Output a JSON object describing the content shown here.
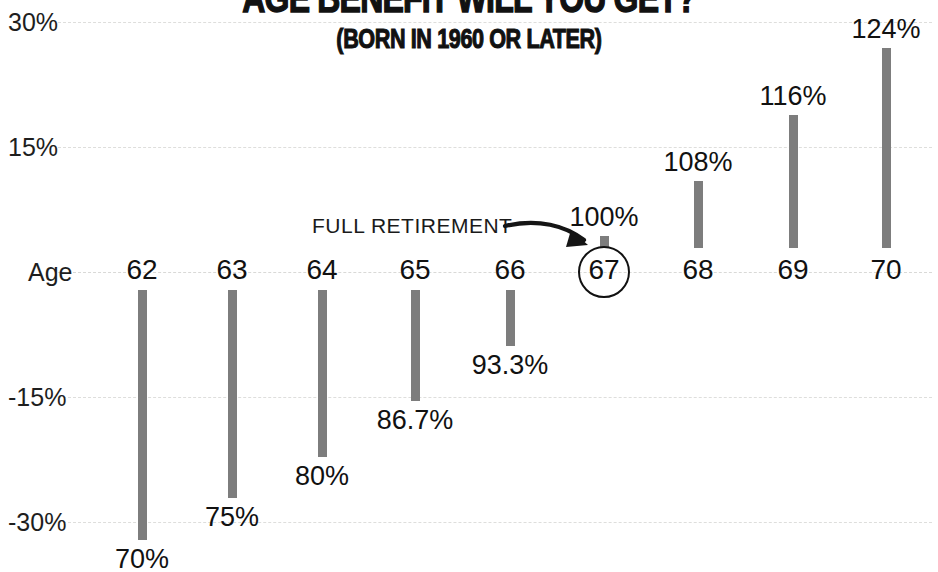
{
  "title": "AGE BENEFIT WILL YOU GET?",
  "subtitle": "(BORN IN 1960 OR LATER)",
  "axis_label": "Age",
  "annotation": "FULL RETIREMENT",
  "colors": {
    "bar": "#7d7d7d",
    "text": "#111111",
    "grid": "#dededc",
    "background": "#ffffff"
  },
  "yticks": [
    {
      "label": "30%",
      "value": 30
    },
    {
      "label": "15%",
      "value": 15
    },
    {
      "label": "Age",
      "value": 0
    },
    {
      "label": "-15%",
      "value": -15
    },
    {
      "label": "-30%",
      "value": -30
    }
  ],
  "bars": [
    {
      "age": "62",
      "value_label": "70%",
      "percent": 70
    },
    {
      "age": "63",
      "value_label": "75%",
      "percent": 75
    },
    {
      "age": "64",
      "value_label": "80%",
      "percent": 80
    },
    {
      "age": "65",
      "value_label": "86.7%",
      "percent": 86.7
    },
    {
      "age": "66",
      "value_label": "93.3%",
      "percent": 93.3
    },
    {
      "age": "67",
      "value_label": "100%",
      "percent": 100
    },
    {
      "age": "68",
      "value_label": "108%",
      "percent": 108
    },
    {
      "age": "69",
      "value_label": "116%",
      "percent": 116
    },
    {
      "age": "70",
      "value_label": "124%",
      "percent": 124
    }
  ],
  "chart_data": {
    "type": "bar",
    "title": "AGE BENEFIT WILL YOU GET?",
    "subtitle": "(BORN IN 1960 OR LATER)",
    "xlabel": "Age",
    "ylabel": "",
    "categories": [
      "62",
      "63",
      "64",
      "65",
      "66",
      "67",
      "68",
      "69",
      "70"
    ],
    "values": [
      -30,
      -25,
      -20,
      -13.3,
      -6.7,
      0,
      8,
      16,
      24
    ],
    "data_labels": [
      "70%",
      "75%",
      "80%",
      "86.7%",
      "93.3%",
      "100%",
      "108%",
      "116%",
      "124%"
    ],
    "benefit_percent_of_full": [
      70,
      75,
      80,
      86.7,
      93.3,
      100,
      108,
      116,
      124
    ],
    "ylim": [
      -30,
      30
    ],
    "ytick_labels": [
      "30%",
      "15%",
      "Age",
      "-15%",
      "-30%"
    ],
    "ytick_values": [
      30,
      15,
      0,
      -15,
      -30
    ],
    "grid": true,
    "legend": "none",
    "annotations": [
      {
        "text": "FULL RETIREMENT",
        "points_to": "67"
      }
    ],
    "highlight": {
      "category": "67",
      "style": "circled"
    },
    "note": "Bars show deviation from the 100% full-retirement benefit; value labels state benefit as percent of full benefit."
  }
}
